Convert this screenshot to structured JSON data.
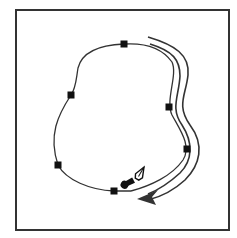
{
  "diagram": {
    "frame": {
      "x": 16,
      "y": 10,
      "width": 213,
      "height": 220,
      "stroke": "#333333",
      "stroke_width": 2
    },
    "path": {
      "stroke": "#333333",
      "stroke_width": 1.3,
      "d": "M 131 191 C 150 186 172 176 183 160 C 192 146 180 130 172 115 C 165 100 178 75 172 62 C 160 45 140 43 124 44 C 100 45 82 52 78 68 C 76 80 76 88 71 95 C 58 115 48 135 58 165 C 66 180 90 190 114 191 C 120 191 126 191 131 191"
    },
    "anchors": [
      {
        "x": 124,
        "y": 44
      },
      {
        "x": 71,
        "y": 95
      },
      {
        "x": 169,
        "y": 107
      },
      {
        "x": 187,
        "y": 149
      },
      {
        "x": 58,
        "y": 165
      },
      {
        "x": 114,
        "y": 191
      }
    ],
    "anchor_size": 7,
    "anchor_color": "#111111",
    "direction_arrow": {
      "stroke": "#333333",
      "d_outer": "M 148 37 C 175 45 190 55 188 75 C 186 95 176 105 190 125 C 205 145 200 165 185 180 C 172 192 160 197 148 200",
      "d_inner": "M 150 44 C 173 51 180 60 180 76 C 179 96 170 108 182 125 C 193 142 193 160 180 173 C 168 184 158 190 148 194",
      "head": "M 137 199 L 158 190 L 152 197 L 156 205 Z"
    },
    "pen_cursor": {
      "x": 132,
      "y": 190,
      "angle": 30,
      "semantic": "pen-tool-close-path-cursor"
    }
  }
}
